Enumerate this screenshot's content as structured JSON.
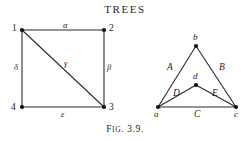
{
  "page": {
    "running_head": "TREES",
    "caption_prefix": "F",
    "caption_smallcaps": "IG",
    "caption_suffix": ". 3.9.",
    "background_color": "#ffffff",
    "ink_color": "#1b1b1b"
  },
  "figures": [
    {
      "id": "left-graph",
      "name": "labeled-square-graph",
      "vertices": [
        {
          "id": "v1",
          "label": "1",
          "x": 22,
          "y": 30,
          "label_x": 12,
          "label_y": 24
        },
        {
          "id": "v2",
          "label": "2",
          "x": 104,
          "y": 30,
          "label_x": 109,
          "label_y": 24
        },
        {
          "id": "v3",
          "label": "3",
          "x": 104,
          "y": 107,
          "label_x": 109,
          "label_y": 103
        },
        {
          "id": "v4",
          "label": "4",
          "x": 22,
          "y": 107,
          "label_x": 11,
          "label_y": 103
        }
      ],
      "edges": [
        {
          "id": "e-alpha",
          "label": "α",
          "from": "v1",
          "to": "v2",
          "label_x": 63,
          "label_y": 21
        },
        {
          "id": "e-beta",
          "label": "β",
          "from": "v2",
          "to": "v3",
          "label_x": 107,
          "label_y": 63
        },
        {
          "id": "e-delta",
          "label": "δ",
          "from": "v1",
          "to": "v4",
          "label_x": 14,
          "label_y": 63
        },
        {
          "id": "e-epsilon",
          "label": "ε",
          "from": "v4",
          "to": "v3",
          "label_x": 61,
          "label_y": 110
        },
        {
          "id": "e-gamma",
          "label": "γ",
          "from": "v1",
          "to": "v3",
          "label_x": 64,
          "label_y": 59
        }
      ]
    },
    {
      "id": "right-graph",
      "name": "labeled-triangle-graph",
      "vertices": [
        {
          "id": "vb",
          "label": "b",
          "x": 196,
          "y": 46,
          "label_x": 193,
          "label_y": 33
        },
        {
          "id": "va",
          "label": "a",
          "x": 158,
          "y": 107,
          "label_x": 154,
          "label_y": 110
        },
        {
          "id": "vc",
          "label": "c",
          "x": 236,
          "y": 107,
          "label_x": 234,
          "label_y": 110
        },
        {
          "id": "vd",
          "label": "d",
          "x": 196,
          "y": 85,
          "label_x": 193,
          "label_y": 72
        }
      ],
      "edges": [
        {
          "id": "e-A",
          "label": "A",
          "from": "va",
          "to": "vb",
          "label_x": 167,
          "label_y": 63
        },
        {
          "id": "e-B",
          "label": "B",
          "from": "vb",
          "to": "vc",
          "label_x": 219,
          "label_y": 63
        },
        {
          "id": "e-C",
          "label": "C",
          "from": "va",
          "to": "vc",
          "label_x": 194,
          "label_y": 110
        },
        {
          "id": "e-D",
          "label": "D",
          "from": "va",
          "to": "vd",
          "label_x": 173,
          "label_y": 89
        },
        {
          "id": "e-E",
          "label": "E",
          "from": "vd",
          "to": "vc",
          "label_x": 212,
          "label_y": 89
        }
      ]
    }
  ]
}
